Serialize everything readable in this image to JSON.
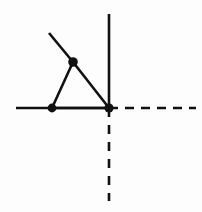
{
  "figure": {
    "canvas": {
      "width": 202,
      "height": 212,
      "background_color": "#fdfdfd"
    },
    "stroke_color": "#111111",
    "node_color": "#111111",
    "solid_stroke_width": 2.6,
    "dashed_stroke_width": 2.6,
    "dash_pattern_horizontal": "9 7",
    "dash_pattern_vertical": "9 8",
    "nodes": [
      {
        "name": "origin-node",
        "label": "",
        "x": 109,
        "y": 108,
        "radius": 4.6
      },
      {
        "name": "left-node",
        "label": "",
        "x": 52,
        "y": 108,
        "radius": 4.4
      },
      {
        "name": "apex-node",
        "label": "",
        "x": 73,
        "y": 62,
        "radius": 4.8
      }
    ],
    "edges": [
      {
        "name": "horizontal-solid-axis",
        "style": "solid",
        "x1": 16,
        "y1": 108,
        "x2": 109,
        "y2": 108
      },
      {
        "name": "vertical-solid-axis",
        "style": "solid",
        "x1": 109,
        "y1": 14,
        "x2": 109,
        "y2": 108
      },
      {
        "name": "horizontal-dashed-axis",
        "style": "dashed",
        "x1": 109,
        "y1": 108,
        "x2": 196,
        "y2": 108
      },
      {
        "name": "vertical-dashed-axis",
        "style": "dashed",
        "x1": 109,
        "y1": 108,
        "x2": 109,
        "y2": 201
      },
      {
        "name": "triangle-left-edge",
        "style": "solid",
        "x1": 52,
        "y1": 108,
        "x2": 73,
        "y2": 62
      },
      {
        "name": "triangle-right-edge",
        "style": "solid",
        "x1": 73,
        "y1": 62,
        "x2": 109,
        "y2": 108
      },
      {
        "name": "triangle-base-edge",
        "style": "solid",
        "x1": 52,
        "y1": 108,
        "x2": 109,
        "y2": 108
      },
      {
        "name": "apex-tail-edge",
        "style": "solid",
        "x1": 73,
        "y1": 62,
        "x2": 49,
        "y2": 33
      }
    ]
  }
}
